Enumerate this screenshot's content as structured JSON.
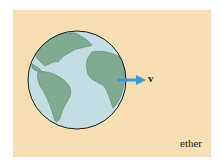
{
  "figure": {
    "background_color": "#f6dfb2",
    "globe": {
      "ocean_color": "#c4dde3",
      "land_color": "#80ab93",
      "outline_color": "#1a1a1a"
    },
    "arrow": {
      "color": "#3a9ad4",
      "label": "v"
    },
    "medium_label": "ether"
  }
}
